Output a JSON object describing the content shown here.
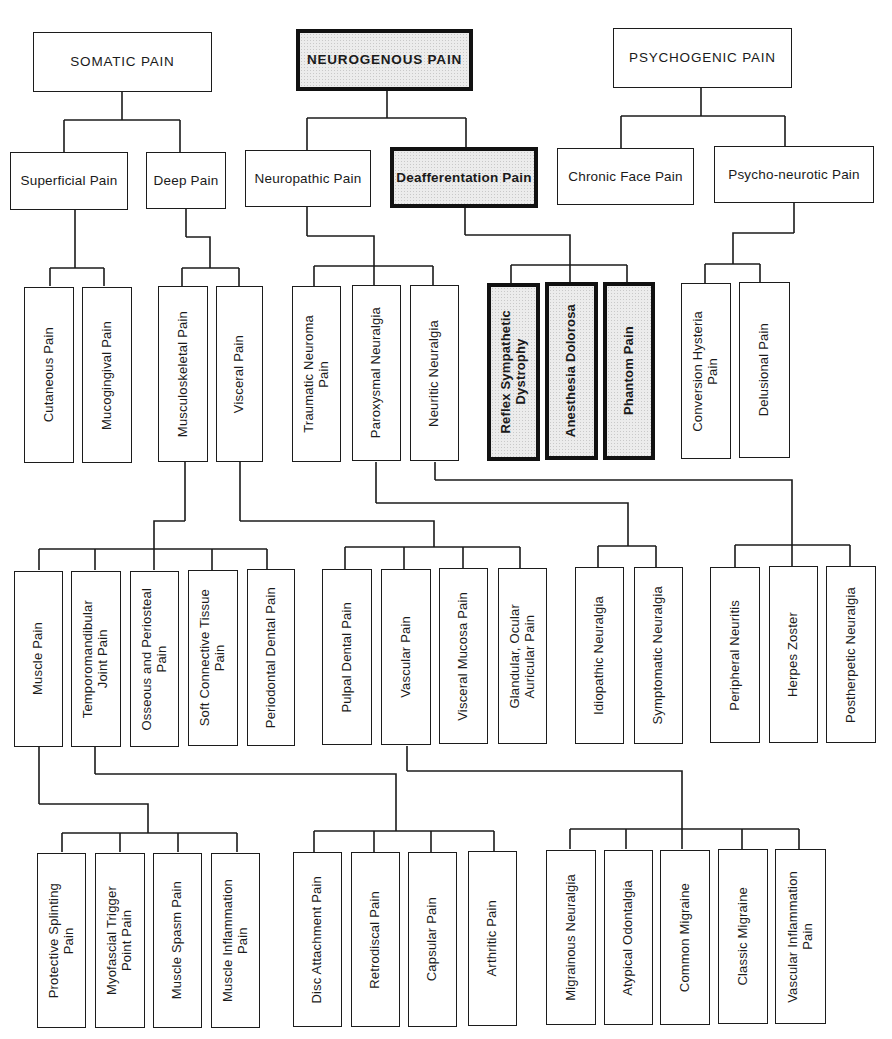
{
  "diagram": {
    "type": "hierarchical-tree",
    "roots": [
      {
        "id": "somatic",
        "label": "SOMATIC PAIN",
        "emphasized": false
      },
      {
        "id": "neurogenous",
        "label": "NEUROGENOUS PAIN",
        "emphasized": true
      },
      {
        "id": "psychogenic",
        "label": "PSYCHOGENIC PAIN",
        "emphasized": false
      }
    ],
    "nodes": {
      "somatic": {
        "label": "SOMATIC PAIN",
        "children": [
          "superficial",
          "deep"
        ]
      },
      "neurogenous": {
        "label": "NEUROGENOUS PAIN",
        "children": [
          "neuropathic",
          "deafferentation"
        ]
      },
      "psychogenic": {
        "label": "PSYCHOGENIC PAIN",
        "children": [
          "chronic_face",
          "psycho_neurotic"
        ]
      },
      "superficial": {
        "label": "Superficial Pain",
        "children": [
          "cutaneous",
          "mucogingival"
        ]
      },
      "deep": {
        "label": "Deep Pain",
        "children": [
          "musculoskeletal",
          "visceral"
        ]
      },
      "neuropathic": {
        "label": "Neuropathic Pain",
        "children": [
          "traumatic_neuroma",
          "paroxysmal",
          "neuritic"
        ]
      },
      "deafferentation": {
        "label": "Deafferentation Pain",
        "children": [
          "reflex_sympathetic",
          "anesthesia_dolorosa",
          "phantom"
        ]
      },
      "chronic_face": {
        "label": "Chronic Face Pain",
        "children": []
      },
      "psycho_neurotic": {
        "label": "Psycho-neurotic Pain",
        "children": [
          "conversion_hysteria",
          "delusional"
        ]
      },
      "cutaneous": {
        "label": "Cutaneous Pain",
        "children": []
      },
      "mucogingival": {
        "label": "Mucogingival Pain",
        "children": []
      },
      "musculoskeletal": {
        "label": "Musculoskeletal Pain",
        "children": [
          "muscle",
          "tmj",
          "osseous",
          "soft_connective",
          "periodontal"
        ]
      },
      "visceral": {
        "label": "Visceral Pain",
        "children": [
          "pulpal",
          "vascular",
          "visceral_mucosa",
          "glandular"
        ]
      },
      "traumatic_neuroma": {
        "label": "Traumatic Neuroma\nPain",
        "children": []
      },
      "paroxysmal": {
        "label": "Paroxysmal Neuralgia",
        "children": [
          "idiopathic",
          "symptomatic"
        ]
      },
      "neuritic": {
        "label": "Neuritic Neuralgia",
        "children": [
          "peripheral_neuritis",
          "herpes_zoster",
          "postherpetic"
        ]
      },
      "reflex_sympathetic": {
        "label": "Reflex Sympathetic\nDystrophy",
        "children": []
      },
      "anesthesia_dolorosa": {
        "label": "Anesthesia Dolorosa",
        "children": []
      },
      "phantom": {
        "label": "Phantom Pain",
        "children": []
      },
      "conversion_hysteria": {
        "label": "Conversion Hysteria\nPain",
        "children": []
      },
      "delusional": {
        "label": "Delusional Pain",
        "children": []
      },
      "muscle": {
        "label": "Muscle Pain",
        "children": [
          "protective_splinting",
          "myofascial",
          "muscle_spasm",
          "muscle_inflammation"
        ]
      },
      "tmj": {
        "label": "Temporomandibular\nJoint Pain",
        "children": [
          "disc_attachment",
          "retrodiscal",
          "capsular",
          "arthritic"
        ]
      },
      "osseous": {
        "label": "Osseous and Periosteal\nPain",
        "children": []
      },
      "soft_connective": {
        "label": "Soft Connective Tissue\nPain",
        "children": []
      },
      "periodontal": {
        "label": "Periodontal Dental Pain",
        "children": []
      },
      "pulpal": {
        "label": "Pulpal Dental Pain",
        "children": []
      },
      "vascular": {
        "label": "Vascular Pain",
        "children": [
          "migrainous",
          "atypical_odontalgia",
          "common_migraine",
          "classic_migraine",
          "vascular_inflammation"
        ]
      },
      "visceral_mucosa": {
        "label": "Visceral Mucosa Pain",
        "children": []
      },
      "glandular": {
        "label": "Glandular, Ocular\nAuricular Pain",
        "children": []
      },
      "idiopathic": {
        "label": "Idiopathic Neuralgia",
        "children": []
      },
      "symptomatic": {
        "label": "Symptomatic Neuralgia",
        "children": []
      },
      "peripheral_neuritis": {
        "label": "Peripheral Neuritis",
        "children": []
      },
      "herpes_zoster": {
        "label": "Herpes Zoster",
        "children": []
      },
      "postherpetic": {
        "label": "Postherpetic Neuralgia",
        "children": []
      },
      "protective_splinting": {
        "label": "Protective Splinting\nPain",
        "children": []
      },
      "myofascial": {
        "label": "Myofascial Trigger\nPoint Pain",
        "children": []
      },
      "muscle_spasm": {
        "label": "Muscle Spasm Pain",
        "children": []
      },
      "muscle_inflammation": {
        "label": "Muscle Inflammation\nPain",
        "children": []
      },
      "disc_attachment": {
        "label": "Disc Attachment Pain",
        "children": []
      },
      "retrodiscal": {
        "label": "Retrodiscal Pain",
        "children": []
      },
      "capsular": {
        "label": "Capsular Pain",
        "children": []
      },
      "arthritic": {
        "label": "Arthritic Pain",
        "children": []
      },
      "migrainous": {
        "label": "Migrainous Neuralgia",
        "children": []
      },
      "atypical_odontalgia": {
        "label": "Atypical Odontalgia",
        "children": []
      },
      "common_migraine": {
        "label": "Common Migraine",
        "children": []
      },
      "classic_migraine": {
        "label": "Classic Migraine",
        "children": []
      },
      "vascular_inflammation": {
        "label": "Vascular Inflammation\nPain",
        "children": []
      }
    },
    "emphasized_nodes": [
      "neurogenous",
      "deafferentation",
      "reflex_sympathetic",
      "anesthesia_dolorosa",
      "phantom"
    ],
    "colors": {
      "line": "#1c1c1c",
      "emphasis_fill": "#ececec",
      "background": "#ffffff"
    }
  }
}
